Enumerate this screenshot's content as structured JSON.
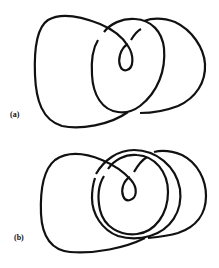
{
  "figures": [
    {
      "id": "a",
      "label": "(a)",
      "description": "Knot diagram with a large left lobe, a central circle, a small inner kink loop, and a right lobe"
    },
    {
      "id": "b",
      "label": "(b)",
      "description": "Knot diagram similar to (a) with an extra concentric strand forming a double circle around the inner kink loop"
    }
  ],
  "colors": {
    "stroke": "#111111",
    "background": "#ffffff"
  }
}
